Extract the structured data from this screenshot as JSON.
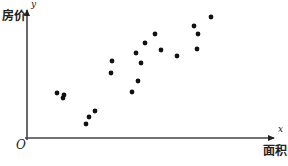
{
  "chart_data": {
    "type": "scatter",
    "title": "",
    "xlabel": "面积",
    "ylabel": "房价",
    "x_axis_var": "x",
    "y_axis_var": "y",
    "origin_label": "O",
    "grid": false,
    "legend": null,
    "ticks": "none (no numeric scale shown)",
    "units_note": "coordinates are relative pixel offsets from origin O (x right, y up); axes have no numeric scale",
    "axis_extent": {
      "x_max": 247,
      "y_max": 129
    },
    "points": [
      {
        "x": 30,
        "y": 45
      },
      {
        "x": 37,
        "y": 43
      },
      {
        "x": 36,
        "y": 40
      },
      {
        "x": 59,
        "y": 14
      },
      {
        "x": 62,
        "y": 21
      },
      {
        "x": 68,
        "y": 27
      },
      {
        "x": 85,
        "y": 77
      },
      {
        "x": 84,
        "y": 65
      },
      {
        "x": 105,
        "y": 46
      },
      {
        "x": 111,
        "y": 57
      },
      {
        "x": 109,
        "y": 85
      },
      {
        "x": 114,
        "y": 75
      },
      {
        "x": 118,
        "y": 95
      },
      {
        "x": 128,
        "y": 104
      },
      {
        "x": 134,
        "y": 88
      },
      {
        "x": 150,
        "y": 82
      },
      {
        "x": 167,
        "y": 112
      },
      {
        "x": 171,
        "y": 104
      },
      {
        "x": 170,
        "y": 89
      },
      {
        "x": 184,
        "y": 121
      }
    ]
  },
  "labels": {
    "ylabel": "房价",
    "xlabel": "面积",
    "yvar": "y",
    "xvar": "x",
    "origin": "O"
  },
  "style": {
    "axis_color": "#333333",
    "point_color": "#111111"
  }
}
